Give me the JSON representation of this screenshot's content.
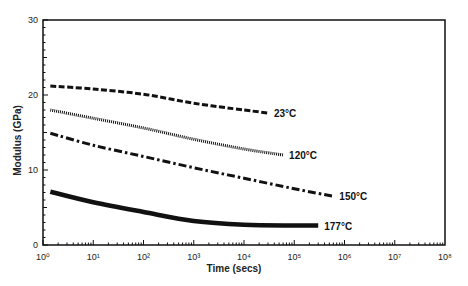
{
  "chart_data": {
    "type": "line",
    "title": "",
    "xlabel": "Time (secs)",
    "ylabel": "Modulus (GPa)",
    "xscale": "log",
    "xlim": [
      1,
      100000000
    ],
    "ylim": [
      0,
      30
    ],
    "x_tick_labels": [
      "10⁰",
      "10¹",
      "10²",
      "10³",
      "10⁴",
      "10⁵",
      "10⁶",
      "10⁷",
      "10⁸"
    ],
    "y_tick_labels": [
      "0",
      "10",
      "20",
      "30"
    ],
    "grid": false,
    "legend": "inline labels at line ends",
    "series": [
      {
        "name": "23°C",
        "style": "dashed",
        "x": [
          1.4,
          10,
          100,
          1000,
          10000,
          30000
        ],
        "y": [
          21.2,
          20.8,
          20.1,
          18.9,
          18.0,
          17.6
        ]
      },
      {
        "name": "120°C",
        "style": "dotted",
        "x": [
          1.4,
          10,
          100,
          1000,
          10000,
          60000
        ],
        "y": [
          18.0,
          16.9,
          15.6,
          14.1,
          12.8,
          12.0
        ]
      },
      {
        "name": "150°C",
        "style": "dash-dot",
        "x": [
          1.4,
          10,
          100,
          1000,
          10000,
          100000,
          600000
        ],
        "y": [
          14.9,
          13.3,
          11.8,
          10.3,
          8.9,
          7.5,
          6.5
        ]
      },
      {
        "name": "177°C",
        "style": "solid-thick",
        "x": [
          1.4,
          10,
          100,
          1000,
          10000,
          100000,
          300000
        ],
        "y": [
          7.1,
          5.7,
          4.4,
          3.2,
          2.7,
          2.6,
          2.6
        ]
      }
    ]
  }
}
